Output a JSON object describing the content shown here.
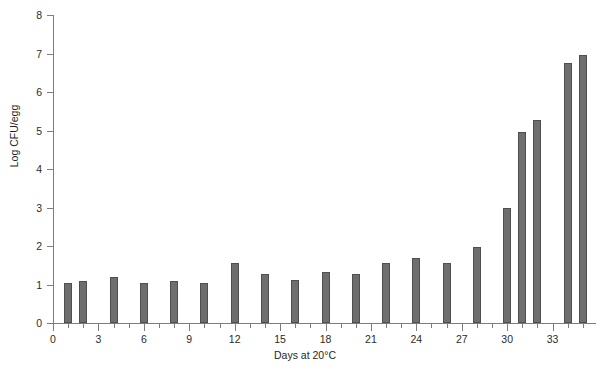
{
  "chart_data": {
    "type": "bar",
    "title": "",
    "xlabel": "Days at 20°C",
    "ylabel": "Log CFU/egg",
    "xlim": [
      0,
      35.8
    ],
    "ylim": [
      0,
      8
    ],
    "grid": false,
    "legend": null,
    "x_tick_labels": [
      "0",
      "3",
      "6",
      "9",
      "12",
      "15",
      "18",
      "21",
      "24",
      "27",
      "30",
      "33"
    ],
    "x_tick_values": [
      0,
      3,
      6,
      9,
      12,
      15,
      18,
      21,
      24,
      27,
      30,
      33
    ],
    "x_minor_tick_values": [
      1,
      2,
      4,
      5,
      7,
      8,
      10,
      11,
      13,
      14,
      16,
      17,
      19,
      20,
      22,
      23,
      25,
      26,
      28,
      29,
      31,
      32,
      34,
      35
    ],
    "y_tick_labels": [
      "0",
      "1",
      "2",
      "3",
      "4",
      "5",
      "6",
      "7",
      "8"
    ],
    "y_tick_values": [
      0,
      1,
      2,
      3,
      4,
      5,
      6,
      7,
      8
    ],
    "bar_color": "#6e6e6e",
    "bar_edge_color": "#4f4f4f",
    "axis_color": "#7d7d7d",
    "x": [
      1,
      2,
      4,
      6,
      8,
      10,
      12,
      14,
      16,
      18,
      20,
      22,
      24,
      26,
      28,
      30,
      31,
      32,
      34,
      35
    ],
    "values": [
      1.03,
      1.1,
      1.2,
      1.03,
      1.1,
      1.03,
      1.55,
      1.28,
      1.11,
      1.32,
      1.28,
      1.57,
      1.68,
      1.55,
      1.97,
      3.0,
      4.95,
      5.28,
      6.75,
      6.95
    ]
  }
}
